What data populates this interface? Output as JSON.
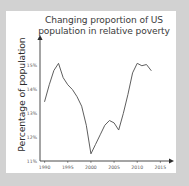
{
  "figure": {
    "background_color": "#d2d2d2",
    "panel_color": "#ffffff",
    "title_line_1": "Changing proportion of US",
    "title_line_2": "population in relative poverty",
    "ylabel": "Percentage of population"
  },
  "chart_data": {
    "type": "line",
    "title": "Changing proportion of US population in relative poverty",
    "xlabel": "",
    "ylabel": "Percentage of population",
    "xlim": [
      1989,
      2016
    ],
    "ylim": [
      11,
      15.45
    ],
    "grid": false,
    "legend": null,
    "line_color": "#555555",
    "xticks": [
      1990,
      1995,
      2000,
      2005,
      2010,
      2015
    ],
    "xtick_labels": [
      "1990",
      "1995",
      "2000",
      "2005",
      "2010",
      "2015"
    ],
    "yticks": [
      11,
      12,
      13,
      14,
      15
    ],
    "ytick_labels": [
      "11%",
      "12%",
      "13%",
      "14%",
      "15%"
    ],
    "x": [
      1990,
      1991,
      1992,
      1993,
      1994,
      1995,
      1996,
      1997,
      1998,
      1999,
      2000,
      2001,
      2002,
      2003,
      2004,
      2005,
      2006,
      2007,
      2008,
      2009,
      2010,
      2011,
      2012,
      2013
    ],
    "values": [
      13.5,
      14.2,
      14.8,
      15.1,
      14.5,
      14.2,
      14.0,
      13.7,
      13.3,
      12.5,
      11.3,
      11.7,
      12.1,
      12.5,
      12.7,
      12.6,
      12.3,
      13.0,
      13.8,
      14.7,
      15.1,
      15.0,
      15.05,
      14.8
    ]
  }
}
